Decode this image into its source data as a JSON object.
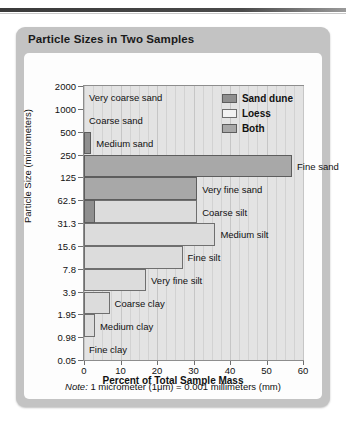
{
  "figure": {
    "title": "Particle Sizes in Two Samples",
    "note_prefix": "Note:",
    "note_text": " 1 micrometer (1μm) = 0.001 millimeters (mm)"
  },
  "chart_data": {
    "type": "bar",
    "orientation": "horizontal",
    "title": "Particle Sizes in Two Samples",
    "xlabel": "Percent of Total Sample Mass",
    "ylabel": "Particle Size (micrometers)",
    "xlim": [
      0,
      60
    ],
    "xticks": [
      0,
      10,
      20,
      30,
      40,
      50,
      60
    ],
    "ytick_labels": [
      "2000",
      "1000",
      "500",
      "250",
      "125",
      "62.5",
      "31.3",
      "15.6",
      "7.8",
      "3.9",
      "1.95",
      "0.98",
      "0.05"
    ],
    "grid": true,
    "legend_position": "top-right",
    "legend": [
      {
        "name": "Sand dune",
        "color": "#8f8f8f"
      },
      {
        "name": "Loess",
        "color": "#f2f2f2"
      },
      {
        "name": "Both",
        "color": "#a8a8a8"
      }
    ],
    "categories": [
      "Very coarse sand",
      "Coarse sand",
      "Medium sand",
      "Fine sand",
      "Very fine sand",
      "Coarse silt",
      "Medium silt",
      "Fine silt",
      "Very fine silt",
      "Coarse clay",
      "Medium clay",
      "Fine clay"
    ],
    "bands": [
      {
        "label": "Very coarse sand",
        "from": "2000",
        "to": "1000",
        "sand_dune": 0,
        "loess": 0,
        "both": 0
      },
      {
        "label": "Coarse sand",
        "from": "1000",
        "to": "500",
        "sand_dune": 0,
        "loess": 0,
        "both": 0
      },
      {
        "label": "Medium sand",
        "from": "500",
        "to": "250",
        "sand_dune": 2,
        "loess": 0,
        "both": 0
      },
      {
        "label": "Fine sand",
        "from": "250",
        "to": "125",
        "sand_dune": 0,
        "loess": 0,
        "both": 57
      },
      {
        "label": "Very fine sand",
        "from": "125",
        "to": "62.5",
        "sand_dune": 0,
        "loess": 0,
        "both": 31
      },
      {
        "label": "Coarse silt",
        "from": "62.5",
        "to": "31.3",
        "sand_dune": 3,
        "loess": 31,
        "both": 0
      },
      {
        "label": "Medium silt",
        "from": "31.3",
        "to": "15.6",
        "sand_dune": 0,
        "loess": 36,
        "both": 0
      },
      {
        "label": "Fine silt",
        "from": "15.6",
        "to": "7.8",
        "sand_dune": 0,
        "loess": 27,
        "both": 0
      },
      {
        "label": "Very fine silt",
        "from": "7.8",
        "to": "3.9",
        "sand_dune": 0,
        "loess": 17,
        "both": 0
      },
      {
        "label": "Coarse clay",
        "from": "3.9",
        "to": "1.95",
        "sand_dune": 0,
        "loess": 7,
        "both": 0
      },
      {
        "label": "Medium clay",
        "from": "1.95",
        "to": "0.98",
        "sand_dune": 0,
        "loess": 3,
        "both": 0
      },
      {
        "label": "Fine clay",
        "from": "0.98",
        "to": "0.05",
        "sand_dune": 0,
        "loess": 0,
        "both": 0
      }
    ]
  }
}
